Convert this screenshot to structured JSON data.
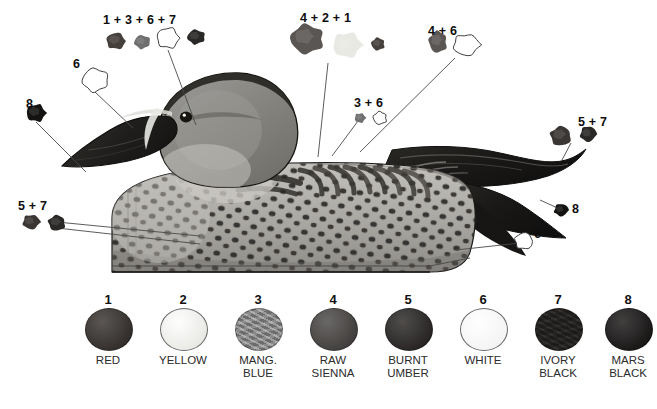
{
  "figure": {
    "background_color": "#ffffff"
  },
  "callouts": [
    {
      "id": "c1",
      "label": "1 + 3 + 6 + 7",
      "label_x": 103,
      "label_y": 14,
      "blobs": [
        "1",
        "3",
        "6",
        "7"
      ],
      "leader": "M168,50 L196,125"
    },
    {
      "id": "c2",
      "label": "6",
      "label_x": 73,
      "label_y": 58,
      "blobs": [
        "6"
      ],
      "leader": "M95,92 L133,128"
    },
    {
      "id": "c3",
      "label": "8",
      "label_x": 26,
      "label_y": 98,
      "blobs": [
        "8"
      ],
      "leader": "M36,122 L86,172"
    },
    {
      "id": "c4",
      "label": "4 + 2 + 1",
      "label_x": 300,
      "label_y": 12,
      "blobs": [
        "4",
        "2",
        "1"
      ],
      "leader": "M328,63 L318,157"
    },
    {
      "id": "c5",
      "label": "3 + 6",
      "label_x": 354,
      "label_y": 97,
      "blobs": [
        "3",
        "6"
      ],
      "leader": "M358,121 L332,156"
    },
    {
      "id": "c6",
      "label": "4 + 6",
      "label_x": 428,
      "label_y": 25,
      "blobs": [
        "4",
        "6"
      ],
      "leader": "M455,58 L360,152"
    },
    {
      "id": "c7",
      "label": "5 + 7",
      "label_x": 18,
      "label_y": 200,
      "blobs": [
        "5",
        "7"
      ],
      "leader": "M57,222 L200,236"
    },
    {
      "id": "c8",
      "label": "5 + 7",
      "label_x": 578,
      "label_y": 116,
      "blobs": [
        "5",
        "7"
      ],
      "leader": "M571,143 L562,160"
    },
    {
      "id": "c9",
      "label": "8",
      "label_x": 572,
      "label_y": 203,
      "blobs": [
        "8"
      ],
      "leader": "M562,210 L540,200"
    },
    {
      "id": "c10",
      "label": "6",
      "label_x": 534,
      "label_y": 228,
      "blobs": [
        "6"
      ],
      "leader": "M520,243 L456,250"
    }
  ],
  "legend": {
    "swatches": [
      {
        "number": "1",
        "name": "RED",
        "color": "#3b3633",
        "outline": false,
        "textured": false
      },
      {
        "number": "2",
        "name": "YELLOW",
        "color": "#f2f2ee",
        "outline": true,
        "textured": false
      },
      {
        "number": "3",
        "name": "MANG.\nBLUE",
        "color": "#8c8c8c",
        "outline": false,
        "textured": true
      },
      {
        "number": "4",
        "name": "RAW\nSIENNA",
        "color": "#4e4b49",
        "outline": false,
        "textured": false
      },
      {
        "number": "5",
        "name": "BURNT\nUMBER",
        "color": "#2e2b29",
        "outline": false,
        "textured": false
      },
      {
        "number": "6",
        "name": "WHITE",
        "color": "#ffffff",
        "outline": true,
        "textured": false
      },
      {
        "number": "7",
        "name": "IVORY\nBLACK",
        "color": "#262422",
        "outline": false,
        "textured": true
      },
      {
        "number": "8",
        "name": "MARS\nBLACK",
        "color": "#1d1b1a",
        "outline": false,
        "textured": false
      }
    ],
    "swatch_x": [
      85,
      160,
      235,
      310,
      385,
      460,
      535,
      605
    ],
    "swatch_y": 308,
    "number_y": 293,
    "name_y": 354
  },
  "palette": {
    "blob_1": "#46403d",
    "blob_2": "#e9e9e4",
    "blob_3": "#6f6f6f",
    "blob_4": "#5a5653",
    "blob_5": "#3a3634",
    "blob_6": "#ffffff",
    "blob_7": "#2a2826",
    "blob_8": "#141312",
    "body_light": "#b9b7b2",
    "body_mid": "#8e8c88",
    "speckle": "#2d2b29",
    "head_gray": "#8b8b8a",
    "bill_dark": "#232220",
    "tail_dark": "#1c1b19",
    "outline": "#111111",
    "leader_line": "#4a4a4a"
  }
}
